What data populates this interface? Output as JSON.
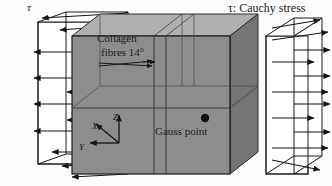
{
  "figure": {
    "type": "mechanics-diagram",
    "labels": {
      "tau_left": "τ",
      "tau_legend": "τ: Cauchy stress",
      "collagen_line1": "Collagen",
      "collagen_line2": "fibres 14°",
      "gauss_point": "Gauss point"
    },
    "axes": {
      "x": "X",
      "y": "Y",
      "z": "Z"
    },
    "values": {
      "fibre_angle_deg": 14,
      "stress_symbol": "τ"
    },
    "colors": {
      "block_front_face": "#8d8d8d",
      "block_top_face": "#b5b5b5",
      "block_side_face": "#6f6f6f",
      "grid_line": "#4a4a4a",
      "outline": "#1a1a1a",
      "arrow": "#141414",
      "background": "#fdfdfd",
      "text": "#1a1a1a"
    },
    "elements": {
      "left_arrow_set": "arrows pointing left (negative X) on the left face",
      "right_arrow_set": "arrows pointing right (positive X) on the right face",
      "block_divisions": "2 rows x 3 columns of finite elements"
    }
  }
}
